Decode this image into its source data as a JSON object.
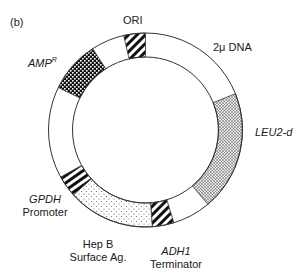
{
  "panel_label": "(b)",
  "ring": {
    "cx": 145.5,
    "cy": 130,
    "r_outer": 97,
    "r_inner": 73,
    "stroke": "#333333"
  },
  "segments": [
    {
      "name": "ORI",
      "start": -13,
      "end": 0,
      "pattern": "diag-hatch"
    },
    {
      "name": "AMP^R",
      "start": -64,
      "end": -33,
      "pattern": "checker"
    },
    {
      "name": "LEU2-d",
      "start": 68,
      "end": 140,
      "pattern": "dense-dots"
    },
    {
      "name": "ADH1 Terminator",
      "start": 163,
      "end": 176,
      "pattern": "diag-hatch"
    },
    {
      "name": "Hep B Surface Ag.",
      "start": 176,
      "end": 228,
      "pattern": "sparse-dots"
    },
    {
      "name": "GPDH Promoter",
      "start": 228,
      "end": 241,
      "pattern": "horiz-stripes"
    }
  ],
  "labels": {
    "ori": "ORI",
    "amp": "AMP",
    "amp_sup": "R",
    "two_micron": "2μ DNA",
    "leu2": "LEU2-d",
    "gpdh_line1": "GPDH",
    "gpdh_line2": "Promoter",
    "hepb_line1": "Hep B",
    "hepb_line2": "Surface Ag.",
    "adh1_line1": "ADH1",
    "adh1_line2": "Terminator"
  }
}
